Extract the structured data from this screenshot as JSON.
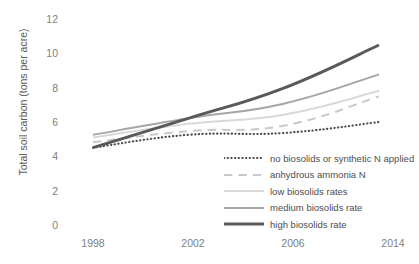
{
  "chart_data": {
    "type": "line",
    "title": "",
    "xlabel": "",
    "ylabel": "Total soil carbon (tons per acre)",
    "categories": [
      "1998",
      "2002",
      "2006",
      "2014"
    ],
    "ylim": [
      0,
      12
    ],
    "yticks": [
      0,
      2,
      4,
      6,
      8,
      10,
      12
    ],
    "grid": false,
    "legend_position": "inside-lower-right",
    "series": [
      {
        "name": "no biosolids or synthetic N applied",
        "values": [
          4.6,
          5.3,
          5.4,
          6.0
        ],
        "style": "dotted",
        "color": "#4d4d4d",
        "width": 2.2
      },
      {
        "name": "anhydrous ammonia N",
        "values": [
          4.9,
          5.5,
          5.8,
          7.4
        ],
        "style": "dashed",
        "color": "#c9c9c9",
        "width": 2.0
      },
      {
        "name": "low biosolids rates",
        "values": [
          5.15,
          5.9,
          6.4,
          7.7
        ],
        "style": "solid",
        "color": "#d9d9d9",
        "width": 2.0
      },
      {
        "name": "medium biosolids rate",
        "values": [
          5.3,
          6.2,
          7.0,
          8.6
        ],
        "style": "solid",
        "color": "#a6a6a6",
        "width": 2.0
      },
      {
        "name": "high biosolids rate",
        "values": [
          4.6,
          6.2,
          7.85,
          10.2
        ],
        "style": "solid",
        "color": "#595959",
        "width": 3.0
      }
    ]
  },
  "axis": {
    "y_tick_labels": [
      "12",
      "10",
      "8",
      "6",
      "4",
      "2",
      "0"
    ],
    "x_tick_labels": [
      "1998",
      "2002",
      "2006",
      "2014"
    ]
  },
  "colors": {
    "background": "#ffffff",
    "tick_text": "#808080",
    "axis_title": "#595959",
    "legend_text": "#4d4d4d"
  }
}
